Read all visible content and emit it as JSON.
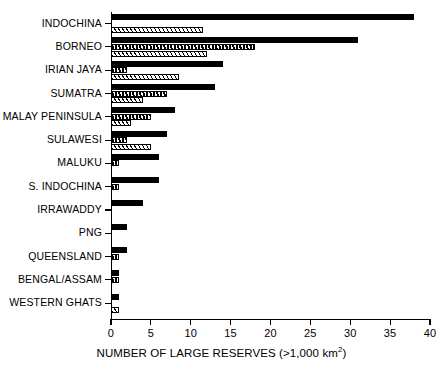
{
  "chart_data": {
    "type": "bar",
    "orientation": "horizontal",
    "title": "",
    "xlabel": "NUMBER OF LARGE RESERVES (>1,000 km2)",
    "ylabel": "",
    "xlim": [
      0,
      40
    ],
    "xticks": [
      0,
      5,
      10,
      15,
      20,
      25,
      30,
      35,
      40
    ],
    "grid": false,
    "legend": "none",
    "categories": [
      "INDOCHINA",
      "BORNEO",
      "IRIAN JAYA",
      "SUMATRA",
      "MALAY PENINSULA",
      "SULAWESI",
      "MALUKU",
      "S. INDOCHINA",
      "IRRAWADDY",
      "PNG",
      "QUEENSLAND",
      "BENGAL/ASSAM",
      "WESTERN GHATS"
    ],
    "series": [
      {
        "name": "total",
        "style": "solid-black",
        "values": [
          38,
          31,
          14,
          13,
          8,
          7,
          6,
          6,
          4,
          2,
          2,
          1,
          1
        ]
      },
      {
        "name": "mid",
        "style": "dense-hatch",
        "values": [
          0,
          18,
          2,
          7,
          5,
          2,
          1,
          1,
          0,
          0,
          1,
          1,
          0
        ]
      },
      {
        "name": "low",
        "style": "light-hatch",
        "values": [
          11.5,
          12,
          8.5,
          4,
          2.5,
          5,
          0,
          0,
          0,
          0,
          0,
          0,
          1
        ]
      }
    ]
  },
  "axis": {
    "tick_labels": [
      "0",
      "5",
      "10",
      "15",
      "20",
      "25",
      "30",
      "35",
      "40"
    ],
    "xlabel_main": "NUMBER OF LARGE RESERVES (>1,000 km",
    "xlabel_sup": "2",
    "xlabel_tail": ")"
  }
}
